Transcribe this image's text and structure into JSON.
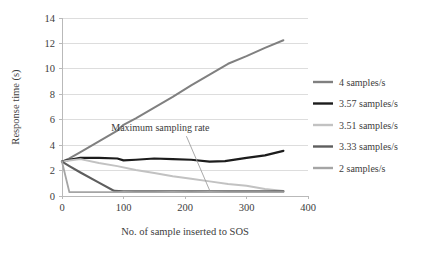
{
  "chart_data": {
    "type": "line",
    "title": "",
    "xlabel": "No. of sample inserted to SOS",
    "ylabel": "Response time (s)",
    "xlim": [
      0,
      400
    ],
    "ylim": [
      0,
      14
    ],
    "xticks": [
      0,
      100,
      200,
      300,
      400
    ],
    "yticks": [
      0,
      2,
      4,
      6,
      8,
      10,
      12,
      14
    ],
    "xtick_labels": [
      "0",
      "100",
      "200",
      "300",
      "400"
    ],
    "ytick_labels": [
      "0",
      "2",
      "4",
      "6",
      "8",
      "10",
      "12",
      "14"
    ],
    "grid": "horizontal",
    "legend_position": "right",
    "annotations": [
      {
        "text": "Maximum sampling rate",
        "x": 160,
        "y": 5.1,
        "leader_to_x": 240,
        "leader_to_y": 0.45
      }
    ],
    "series": [
      {
        "name": "4 samples/s",
        "color": "#808080",
        "width": 2.0,
        "x": [
          0,
          12,
          30,
          60,
          90,
          100,
          120,
          150,
          180,
          210,
          240,
          270,
          300,
          330,
          360
        ],
        "values": [
          2.7,
          2.95,
          3.45,
          4.3,
          5.15,
          5.6,
          6.1,
          6.95,
          7.8,
          8.7,
          9.55,
          10.4,
          11.0,
          11.65,
          12.25
        ]
      },
      {
        "name": "3.57 samples/s",
        "color": "#1c1c1c",
        "width": 2.2,
        "x": [
          0,
          12,
          30,
          60,
          90,
          100,
          120,
          150,
          180,
          210,
          240,
          265,
          300,
          330,
          360
        ],
        "values": [
          2.7,
          2.85,
          3.0,
          3.0,
          2.95,
          2.8,
          2.85,
          2.95,
          2.9,
          2.85,
          2.7,
          2.75,
          3.0,
          3.2,
          3.55
        ]
      },
      {
        "name": "3.51 samples/s",
        "color": "#c2c2c2",
        "width": 2.0,
        "x": [
          0,
          12,
          30,
          60,
          90,
          120,
          150,
          180,
          210,
          240,
          270,
          300,
          330,
          360
        ],
        "values": [
          2.7,
          2.8,
          2.9,
          2.6,
          2.35,
          2.05,
          1.8,
          1.55,
          1.35,
          1.15,
          0.95,
          0.8,
          0.55,
          0.4
        ]
      },
      {
        "name": "3.33 samples/s",
        "color": "#5e5e5e",
        "width": 2.2,
        "x": [
          0,
          12,
          30,
          60,
          85,
          100,
          120,
          150,
          180,
          210,
          240,
          270,
          300,
          330,
          360
        ],
        "values": [
          2.7,
          2.35,
          1.85,
          1.05,
          0.4,
          0.37,
          0.36,
          0.36,
          0.36,
          0.36,
          0.36,
          0.36,
          0.36,
          0.36,
          0.37
        ]
      },
      {
        "name": "2 samples/s",
        "color": "#a5a5a5",
        "width": 1.8,
        "x": [
          0,
          12,
          30,
          60,
          90,
          100,
          120,
          150,
          180,
          210,
          240,
          270,
          300,
          330,
          360
        ],
        "values": [
          2.7,
          0.3,
          0.3,
          0.3,
          0.3,
          0.32,
          0.3,
          0.3,
          0.32,
          0.3,
          0.32,
          0.3,
          0.3,
          0.3,
          0.3
        ]
      }
    ]
  },
  "legend": {
    "items": [
      {
        "label": "4 samples/s"
      },
      {
        "label": "3.57 samples/s"
      },
      {
        "label": "3.51 samples/s"
      },
      {
        "label": "3.33 samples/s"
      },
      {
        "label": "2 samples/s"
      }
    ]
  }
}
